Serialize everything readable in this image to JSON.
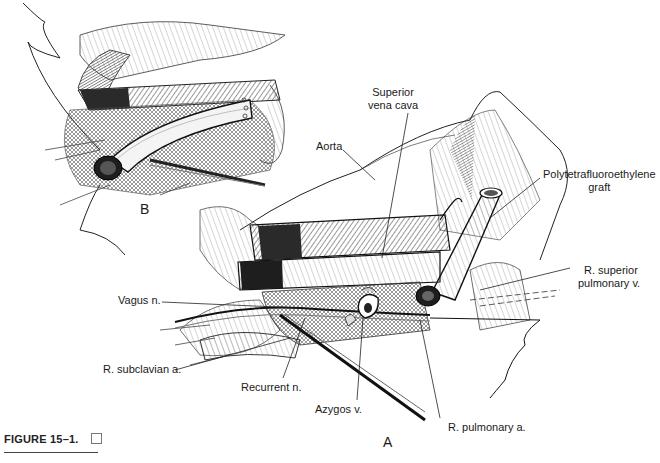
{
  "figure": {
    "caption_label": "FIGURE 15–1.",
    "caption_icon": "checkbox-square-icon",
    "panels": {
      "a": "A",
      "b": "B"
    },
    "labels": {
      "aorta": "Aorta",
      "superior_vena_cava_line1": "Superior",
      "superior_vena_cava_line2": "vena cava",
      "ptfe_graft_line1": "Polytetrafluoroethylene",
      "ptfe_graft_line2": "graft",
      "r_superior_pulmonary_v_line1": "R. superior",
      "r_superior_pulmonary_v_line2": "pulmonary v.",
      "vagus_n": "Vagus n.",
      "r_subclavian_a": "R. subclavian a.",
      "recurrent_n": "Recurrent n.",
      "azygos_v": "Azygos v.",
      "r_pulmonary_a": "R. pulmonary a."
    },
    "colors": {
      "ink": "#1a1a1a",
      "paper": "#ffffff",
      "hatch_dark": "#2a2a2a",
      "hatch_mid": "#6a6a6a"
    }
  }
}
